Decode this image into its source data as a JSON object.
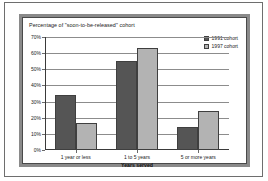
{
  "chart_data": {
    "type": "bar",
    "title": "Percentage of \"soon-to-be-released\" cohort",
    "xlabel": "Years served",
    "ylabel": "",
    "categories": [
      "1 year or less",
      "1 to 5 years",
      "5 or more years"
    ],
    "series": [
      {
        "name": "1991 cohort",
        "color": "#555555",
        "values": [
          34,
          55,
          14
        ]
      },
      {
        "name": "1997 cohort",
        "color": "#b3b3b3",
        "values": [
          17,
          63,
          24
        ]
      }
    ],
    "ylim": [
      0,
      70
    ],
    "ytick_labels": [
      "0%",
      "10%",
      "20%",
      "30%",
      "40%",
      "50%",
      "60%",
      "70%"
    ],
    "ytick_values": [
      0,
      10,
      20,
      30,
      40,
      50,
      60,
      70
    ],
    "grid": true,
    "legend_position": "top-right"
  }
}
